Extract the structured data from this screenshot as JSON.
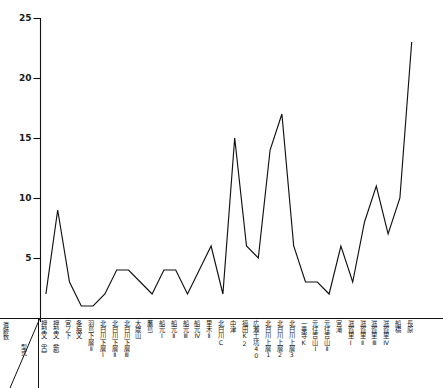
{
  "chart_data": {
    "type": "line",
    "title": "",
    "xlabel": "型式",
    "ylabel": "遺跡数",
    "ylim": [
      0,
      25
    ],
    "yticks": [
      5,
      10,
      15,
      20,
      25
    ],
    "grid": false,
    "legend": "none",
    "line_color": "#111111",
    "categories": [
      "押型文（古）",
      "押型文（新）",
      "宮ノ下",
      "条痕文",
      "羽島下層Ⅱ",
      "北白川下層Ⅰ",
      "北白川下層Ⅱ",
      "北白川下層Ⅲ",
      "大歳山",
      "鷹島",
      "船元Ⅰ",
      "船元Ⅱ",
      "船元Ⅲ",
      "船元Ⅳ",
      "里木Ⅱ",
      "北白川C",
      "中津",
      "福田K2",
      "広瀬土坑40",
      "北白川上層1",
      "北白川上層2",
      "北白川上層3",
      "一乗寺K",
      "元住吉山Ⅰ",
      "元住吉山Ⅱ",
      "宮滝",
      "滋賀里Ⅰ",
      "滋賀里Ⅱ",
      "滋賀里Ⅲ",
      "滋賀里Ⅳ",
      "船橋",
      "長原"
    ],
    "values": [
      2,
      9,
      3,
      1,
      1,
      2,
      4,
      4,
      3,
      2,
      4,
      4,
      2,
      4,
      6,
      2,
      15,
      6,
      5,
      14,
      17,
      6,
      3,
      3,
      2,
      6,
      3,
      8,
      11,
      7,
      10,
      23
    ]
  },
  "axis": {
    "corner_top_label": "遺跡数",
    "corner_bottom_label": "型式"
  }
}
